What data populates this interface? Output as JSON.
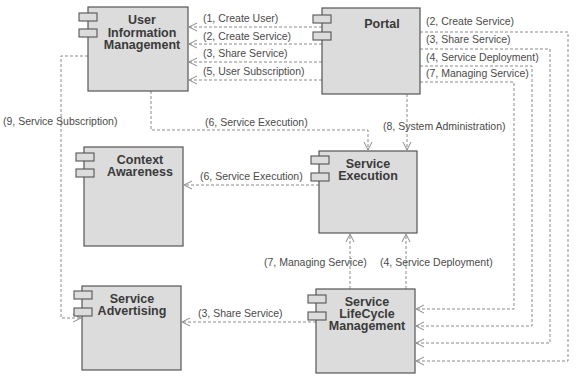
{
  "diagram": {
    "type": "UML component diagram",
    "components": [
      {
        "id": "uim",
        "lines": [
          "User",
          "Information",
          "Management"
        ]
      },
      {
        "id": "portal",
        "lines": [
          "Portal"
        ]
      },
      {
        "id": "ctx",
        "lines": [
          "Context",
          "Awareness"
        ]
      },
      {
        "id": "exec",
        "lines": [
          "Service",
          "Execution"
        ]
      },
      {
        "id": "adv",
        "lines": [
          "Service",
          "Advertising"
        ]
      },
      {
        "id": "lcm",
        "lines": [
          "Service",
          "LifeCycle",
          "Management"
        ]
      }
    ],
    "dependencies": [
      {
        "from": "portal",
        "to": "uim",
        "label": "(1, Create User)"
      },
      {
        "from": "portal",
        "to": "uim",
        "label": "(2, Create Service)"
      },
      {
        "from": "portal",
        "to": "uim",
        "label": "(3, Share Service)"
      },
      {
        "from": "portal",
        "to": "uim",
        "label": "(5, User Subscription)"
      },
      {
        "from": "portal",
        "to": "lcm",
        "label": "(2, Create Service)"
      },
      {
        "from": "portal",
        "to": "lcm",
        "label": "(3, Share Service)"
      },
      {
        "from": "portal",
        "to": "lcm",
        "label": "(4, Service Deployment)"
      },
      {
        "from": "portal",
        "to": "lcm",
        "label": "(7, Managing Service)"
      },
      {
        "from": "uim",
        "to": "exec",
        "label": "(6, Service Execution)"
      },
      {
        "from": "portal",
        "to": "exec",
        "label": "(8, System Administration)"
      },
      {
        "from": "exec",
        "to": "ctx",
        "label": "(6, Service Execution)"
      },
      {
        "from": "uim",
        "to": "adv",
        "label": "(9, Service Subscription)"
      },
      {
        "from": "lcm",
        "to": "exec",
        "label": "(7, Managing Service)"
      },
      {
        "from": "lcm",
        "to": "exec",
        "label": "(4, Service Deployment)"
      },
      {
        "from": "lcm",
        "to": "adv",
        "label": "(3, Share Service)"
      }
    ]
  }
}
